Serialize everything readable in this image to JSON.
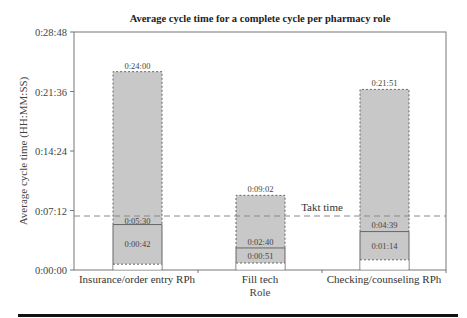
{
  "chart_data": {
    "type": "bar",
    "subtype": "floating-range-box",
    "title": "Average cycle time for a complete cycle per pharmacy role",
    "xlabel": "Role",
    "ylabel": "Average cycle time (HH:MM:SS)",
    "yticks": [
      "0:00:00",
      "0:07:12",
      "0:14:24",
      "0:21:36",
      "0:28:48"
    ],
    "ylim_seconds": [
      0,
      1728
    ],
    "categories": [
      "Insurance/order entry RPh",
      "Fill tech",
      "Checking/counseling RPh"
    ],
    "series": [
      {
        "name": "Max",
        "labels": [
          "0:24:00",
          "0:09:02",
          "0:21:51"
        ],
        "values_seconds": [
          1440,
          542,
          1311
        ]
      },
      {
        "name": "Average",
        "labels": [
          "0:05:30",
          "0:02:40",
          "0:04:39"
        ],
        "values_seconds": [
          330,
          160,
          279
        ]
      },
      {
        "name": "Min",
        "labels": [
          "0:00:42",
          "0:00:51",
          "0:01:14"
        ],
        "values_seconds": [
          42,
          51,
          74
        ]
      }
    ],
    "reference_line": {
      "label": "Takt time",
      "value_seconds": 392
    },
    "grid": false,
    "legend": "none"
  },
  "colors": {
    "bar_fill": "#c8c8c8",
    "bar_border": "#666666",
    "takt_line": "#888888",
    "axis": "#777777"
  }
}
